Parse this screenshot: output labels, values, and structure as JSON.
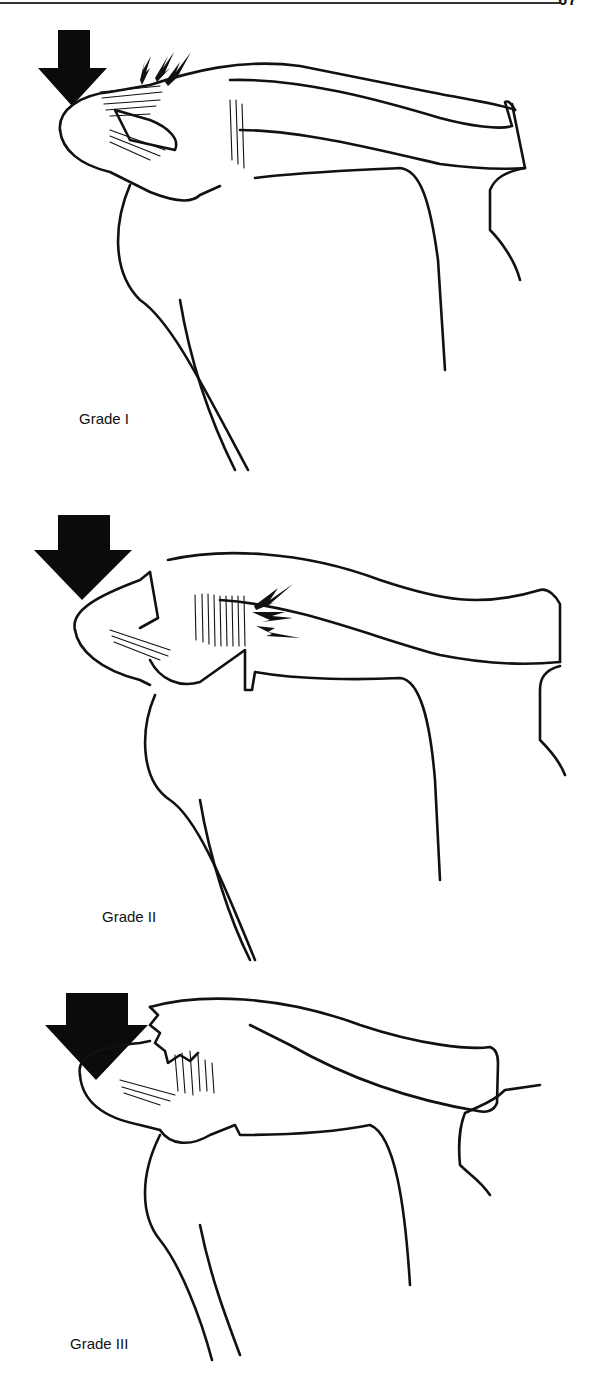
{
  "page": {
    "page_number": "67",
    "figures": [
      {
        "id": "grade-1",
        "caption": "Grade I",
        "arrow": "force-arrow-down",
        "strain_marks": "lightning-bolts-over-ac-ligament"
      },
      {
        "id": "grade-2",
        "caption": "Grade II",
        "arrow": "force-arrow-down",
        "strain_marks": "lightning-bolts-at-coracoclavicular-ligament"
      },
      {
        "id": "grade-3",
        "caption": "Grade III",
        "arrow": "force-arrow-down",
        "strain_marks": "torn-ligaments"
      }
    ],
    "colors": {
      "ink": "#111111",
      "paper": "#ffffff"
    }
  }
}
